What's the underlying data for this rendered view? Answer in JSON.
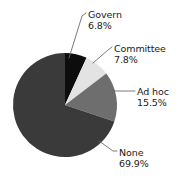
{
  "chart_data": {
    "type": "pie",
    "title": "",
    "subtitle": "",
    "xlabel": "",
    "ylabel": "",
    "legend_position": "none",
    "grid": false,
    "units": "percent",
    "total": 100.0,
    "start_angle_deg": 0,
    "direction": "clockwise",
    "categories": [
      "Govern",
      "Committee",
      "Ad hoc",
      "None"
    ],
    "values": [
      6.8,
      7.8,
      15.5,
      69.9
    ],
    "slices": [
      {
        "label": "Govern",
        "value": 6.8,
        "value_text": "6.8%",
        "color": "#0d0d0d",
        "start_deg": 0.0,
        "end_deg": 24.48
      },
      {
        "label": "Committee",
        "value": 7.8,
        "value_text": "7.8%",
        "color": "#e3e3e3",
        "start_deg": 24.48,
        "end_deg": 52.56
      },
      {
        "label": "Ad hoc",
        "value": 15.5,
        "value_text": "15.5%",
        "color": "#6e6e6e",
        "start_deg": 52.56,
        "end_deg": 108.36
      },
      {
        "label": "None",
        "value": 69.9,
        "value_text": "69.9%",
        "color": "#3a3a3a",
        "start_deg": 108.36,
        "end_deg": 360.0
      }
    ]
  },
  "labels": {
    "govern": {
      "name": "Govern",
      "value": "6.8%"
    },
    "committee": {
      "name": "Committee",
      "value": "7.8%"
    },
    "adhoc": {
      "name": "Ad hoc",
      "value": "15.5%"
    },
    "none": {
      "name": "None",
      "value": "69.9%"
    }
  },
  "style": {
    "background": "#ffffff",
    "text_color": "#1a1a1a",
    "leader_line_color": "#6b6b6b"
  }
}
